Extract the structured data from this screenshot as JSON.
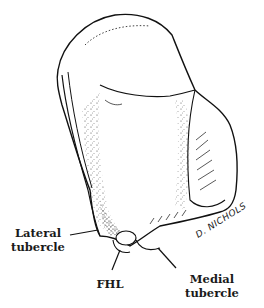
{
  "figure": {
    "labels": {
      "lateral_tubercle_line1": "Lateral",
      "lateral_tubercle_line2": "tubercle",
      "fhl": "FHL",
      "medial_tubercle_line1": "Medial",
      "medial_tubercle_line2": "tubercle"
    },
    "signature": "D. NICHOLS"
  }
}
